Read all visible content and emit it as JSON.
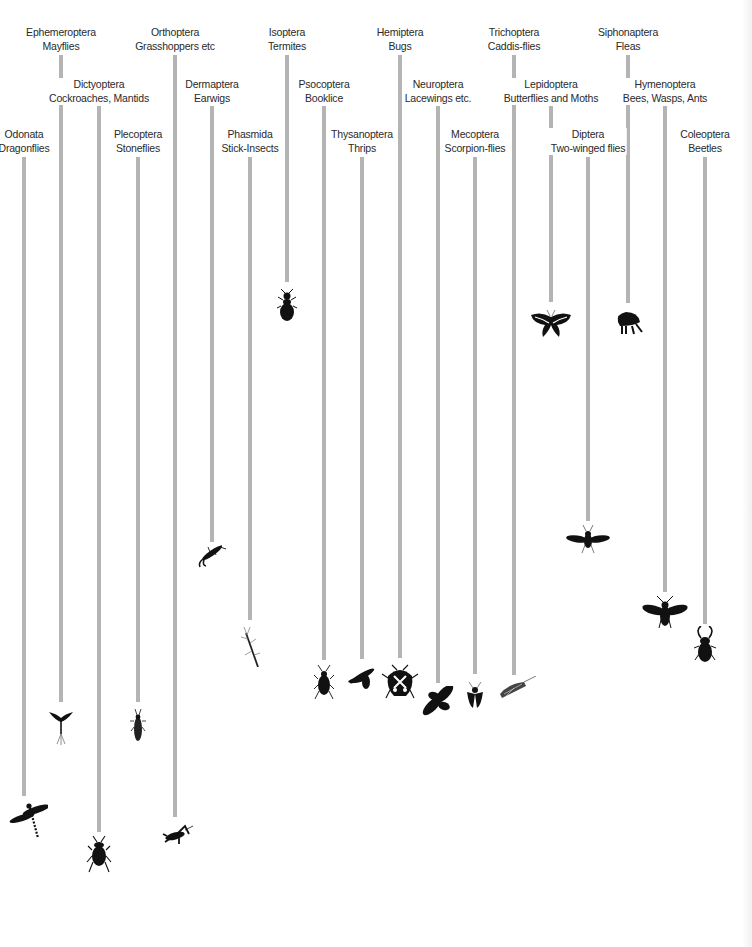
{
  "diagram": {
    "line_color": "#b4b4b4",
    "text_color": "#2a2a2a",
    "silhouette_color": "#111111",
    "orders": [
      {
        "order": "Odonata",
        "common": "Dragonflies",
        "x": 24,
        "label_y": 128,
        "line_top": 157,
        "line_bottom": 796,
        "icon": "dragonfly-icon",
        "icon_y": 796
      },
      {
        "order": "Ephemeroptera",
        "common": "Mayflies",
        "x": 61,
        "label_y": 26,
        "line_top": 55,
        "line_bottom": 702,
        "icon": "mayfly-icon",
        "icon_y": 704
      },
      {
        "order": "Dictyoptera",
        "common": "Cockroaches, Mantids",
        "x": 99,
        "label_y": 78,
        "line_top": 106,
        "line_bottom": 832,
        "icon": "cockroach-icon",
        "icon_y": 834
      },
      {
        "order": "Plecoptera",
        "common": "Stoneflies",
        "x": 138,
        "label_y": 128,
        "line_top": 157,
        "line_bottom": 702,
        "icon": "stonefly-icon",
        "icon_y": 707
      },
      {
        "order": "Orthoptera",
        "common": "Grasshoppers etc",
        "x": 175,
        "label_y": 26,
        "line_top": 55,
        "line_bottom": 817,
        "icon": "grasshopper-icon",
        "icon_y": 822
      },
      {
        "order": "Dermaptera",
        "common": "Earwigs",
        "x": 212,
        "label_y": 78,
        "line_top": 106,
        "line_bottom": 542,
        "icon": "earwig-icon",
        "icon_y": 545
      },
      {
        "order": "Phasmida",
        "common": "Stick-Insects",
        "x": 250,
        "label_y": 128,
        "line_top": 157,
        "line_bottom": 620,
        "icon": "stick-insect-icon",
        "icon_y": 623
      },
      {
        "order": "Isoptera",
        "common": "Termites",
        "x": 287,
        "label_y": 26,
        "line_top": 55,
        "line_bottom": 282,
        "icon": "termite-icon",
        "icon_y": 286
      },
      {
        "order": "Psocoptera",
        "common": "Booklice",
        "x": 324,
        "label_y": 78,
        "line_top": 106,
        "line_bottom": 660,
        "icon": "booklouse-icon",
        "icon_y": 663
      },
      {
        "order": "Thysanoptera",
        "common": "Thrips",
        "x": 362,
        "label_y": 128,
        "line_top": 157,
        "line_bottom": 659,
        "icon": "thrips-icon",
        "icon_y": 662
      },
      {
        "order": "Hemiptera",
        "common": "Bugs",
        "x": 400,
        "label_y": 26,
        "line_top": 55,
        "line_bottom": 658,
        "icon": "shield-bug-icon",
        "icon_y": 662
      },
      {
        "order": "Neuroptera",
        "common": "Lacewings etc.",
        "x": 438,
        "label_y": 78,
        "line_top": 106,
        "line_bottom": 683,
        "icon": "lacewing-icon",
        "icon_y": 686
      },
      {
        "order": "Mecoptera",
        "common": "Scorpion-flies",
        "x": 475,
        "label_y": 128,
        "line_top": 157,
        "line_bottom": 674,
        "icon": "scorpionfly-icon",
        "icon_y": 678
      },
      {
        "order": "Trichoptera",
        "common": "Caddis-flies",
        "x": 514,
        "label_y": 26,
        "line_top": 55,
        "line_bottom": 675,
        "icon": "caddisfly-icon",
        "icon_y": 676
      },
      {
        "order": "Lepidoptera",
        "common": "Butterflies and Moths",
        "x": 551,
        "label_y": 78,
        "line_top": 106,
        "line_bottom": 302,
        "icon": "swallowtail-butterfly-icon",
        "icon_y": 305
      },
      {
        "order": "Diptera",
        "common": "Two-winged flies",
        "x": 588,
        "label_y": 128,
        "line_top": 157,
        "line_bottom": 521,
        "icon": "fly-icon",
        "icon_y": 523
      },
      {
        "order": "Siphonaptera",
        "common": "Fleas",
        "x": 628,
        "label_y": 26,
        "line_top": 55,
        "line_bottom": 303,
        "icon": "flea-icon",
        "icon_y": 306
      },
      {
        "order": "Hymenoptera",
        "common": "Bees, Wasps, Ants",
        "x": 665,
        "label_y": 78,
        "line_top": 106,
        "line_bottom": 592,
        "icon": "bee-icon",
        "icon_y": 594
      },
      {
        "order": "Coleoptera",
        "common": "Beetles",
        "x": 705,
        "label_y": 128,
        "line_top": 157,
        "line_bottom": 624,
        "icon": "beetle-icon",
        "icon_y": 626
      }
    ]
  }
}
